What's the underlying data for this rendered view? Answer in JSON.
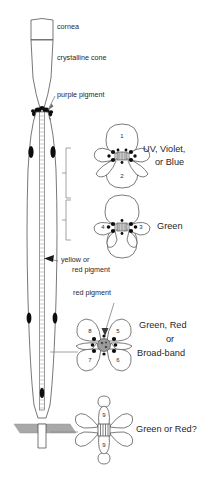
{
  "figure": {
    "type": "diagram"
  },
  "anatomy_labels": [
    {
      "id": "cornea",
      "text": "cornea",
      "x": 57,
      "y": 27
    },
    {
      "id": "crystalline-cone",
      "text": "crystalline cone",
      "x": 57,
      "y": 57
    },
    {
      "id": "purple-pigment",
      "text": "purple pigment",
      "x": 57,
      "y": 94
    },
    {
      "id": "yellow-pigment-line1",
      "text": "yellow or",
      "x": 61,
      "y": 259
    },
    {
      "id": "yellow-pigment-line2",
      "text": "red pigment",
      "x": 72,
      "y": 270
    },
    {
      "id": "red-pigment",
      "text": "red pigment",
      "x": 73,
      "y": 292
    }
  ],
  "spectral_groups": [
    {
      "id": "group-uv-violet-blue",
      "label_lines": [
        "UV, Violet,",
        "or Blue"
      ],
      "cells": [
        "1",
        "2"
      ],
      "rosette_center": {
        "x": 122,
        "y": 156
      },
      "label_x": 145,
      "label_y": 143,
      "bracket": {
        "x": 66,
        "y_top": 148,
        "y_bottom": 198
      },
      "pigment_color": "#0d0d0d"
    },
    {
      "id": "group-green",
      "label_lines": [
        "Green"
      ],
      "cells": [
        "4",
        "3"
      ],
      "rosette_center": {
        "x": 122,
        "y": 227
      },
      "label_x": 156,
      "label_y": 223,
      "bracket": {
        "x": 66,
        "y_top": 198,
        "y_bottom": 238
      },
      "pigment_color": "#0d0d0d"
    },
    {
      "id": "group-green-red-broadband",
      "label_lines": [
        "Green, Red",
        "or",
        "Broad-band"
      ],
      "cells": [
        "8",
        "5",
        "7",
        "6"
      ],
      "rosette_center": {
        "x": 104,
        "y": 345
      },
      "label_x": 142,
      "label_y": 327,
      "connector": {
        "x1": 50,
        "y1": 352,
        "x2": 78,
        "y2": 352
      },
      "pigment_color": "#0d0d0d"
    },
    {
      "id": "group-green-or-red",
      "label_lines": [
        "Green or Red?"
      ],
      "cells": [
        "9",
        "9"
      ],
      "rosette_center": {
        "x": 104,
        "y": 430
      },
      "label_x": 140,
      "label_y": 426,
      "connector": {
        "x1": 50,
        "y1": 432,
        "x2": 78,
        "y2": 432
      },
      "pigment_color": "#0d0d0d"
    }
  ],
  "colors": {
    "outline": "#4a4a4a",
    "pigment_granule": "#0d0d0d",
    "basement_membrane": "#a8a8a8",
    "background": "#ffffff",
    "text": "#1f1f1f"
  },
  "structures": {
    "basement_membrane": "basement membrane",
    "rhabdom": "rhabdom",
    "retinula_cell": "retinula cell"
  }
}
